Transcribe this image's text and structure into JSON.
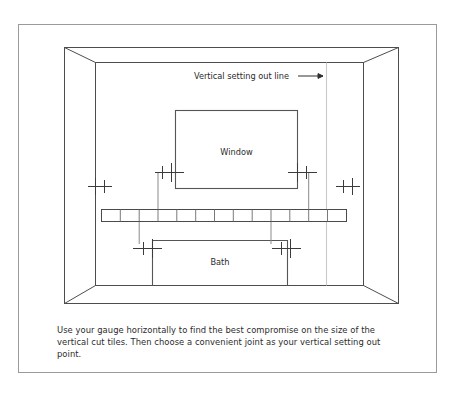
{
  "figure": {
    "title_label": "Tiling setting out diagram",
    "annotations": {
      "vertical_setting_out_line": "Vertical setting out line",
      "arrow_glyph": "⟶"
    },
    "objects": {
      "window_label": "Window",
      "bath_label": "Bath"
    },
    "caption": "Use your gauge horizontally to find the best compromise on the size of the vertical cut tiles. Then choose a convenient joint as your vertical setting out point.",
    "gauge": {
      "tile_count": 13,
      "divider_count": 12
    },
    "colors": {
      "frame_border": "#9a9a9a",
      "room_lines": "#4d4d4d",
      "object_lines": "#555555",
      "gauge_fill": "#ffffff",
      "gauge_stroke": "#4a4a4a",
      "setting_out_line": "#c9c9c9",
      "mark_stroke": "#3b3b3b",
      "text": "#2b2b2b",
      "page_background": "#ffffff"
    }
  }
}
